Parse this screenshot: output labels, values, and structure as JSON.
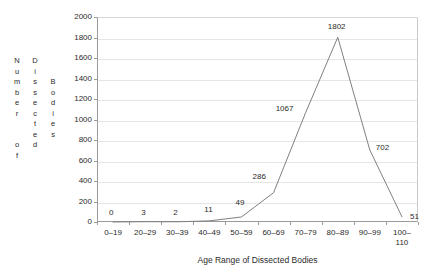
{
  "chart_data": {
    "type": "line",
    "title": "",
    "xlabel": "Age Range of Dissected Bodies",
    "ylabel": "Number of Dissected Bodies",
    "categories": [
      "0–19",
      "20–29",
      "30–39",
      "40–49",
      "50–59",
      "60–69",
      "70–79",
      "80–89",
      "90–99",
      "100–\n110"
    ],
    "values": [
      0,
      3,
      2,
      11,
      49,
      286,
      1067,
      1802,
      702,
      51
    ],
    "point_labels": [
      "0",
      "3",
      "2",
      "11",
      "49",
      "286",
      "1067",
      "1802",
      "702",
      "51"
    ],
    "ylim": [
      0,
      2000
    ],
    "ytick_labels": [
      "2000",
      "1800",
      "1600",
      "1400",
      "1200",
      "1000",
      "800",
      "600",
      "400",
      "200",
      "0"
    ],
    "ytick_values": [
      2000,
      1800,
      1600,
      1400,
      1200,
      1000,
      800,
      600,
      400,
      200,
      0
    ],
    "grid": true,
    "legend": "none",
    "line_color": "#808080",
    "grid_color": "#e6e6e6",
    "axis_color": "#9a9a9a",
    "text_color": "#2b2b2b"
  },
  "ylabel_columns": [
    {
      "id": "number-of",
      "chars": [
        "N",
        "u",
        "m",
        "b",
        "e",
        "r",
        " ",
        " ",
        "o",
        "f"
      ]
    },
    {
      "id": "dissected",
      "chars": [
        "D",
        "i",
        "s",
        "s",
        "e",
        "c",
        "t",
        "e",
        "d"
      ]
    },
    {
      "id": "bodies",
      "chars": [
        "B",
        "o",
        "d",
        "i",
        "e",
        "s"
      ]
    }
  ]
}
